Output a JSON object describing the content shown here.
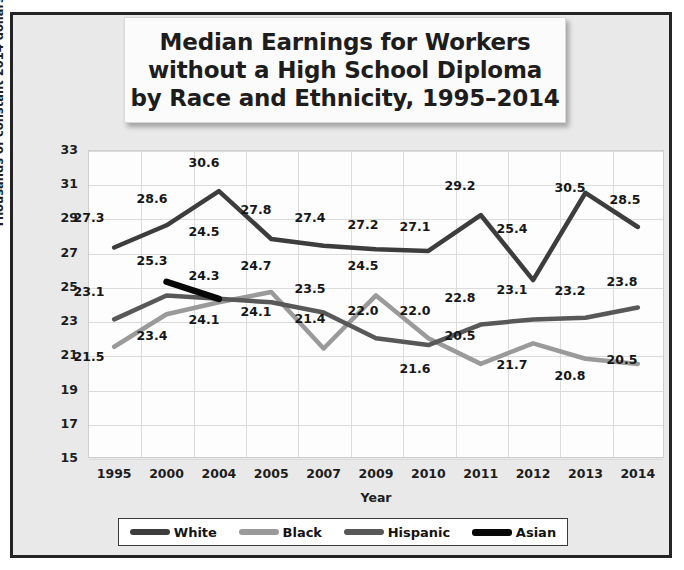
{
  "chart_data": {
    "type": "line",
    "title_lines": [
      "Median Earnings for Workers",
      "without a High School Diploma",
      "by Race and Ethnicity, 1995–2014"
    ],
    "xlabel": "Year",
    "ylabel": "Thousands of constant 2014 dollars",
    "categories": [
      "1995",
      "2000",
      "2004",
      "2005",
      "2007",
      "2009",
      "2010",
      "2011",
      "2012",
      "2013",
      "2014"
    ],
    "ylim": [
      15,
      33
    ],
    "yticks": [
      "33",
      "31",
      "29",
      "27",
      "25",
      "23",
      "21",
      "19",
      "17",
      "15"
    ],
    "grid": true,
    "legend_position": "bottom",
    "series": [
      {
        "name": "White",
        "color": "#3d3d3d",
        "width": 4.5,
        "values": [
          27.3,
          28.6,
          30.6,
          27.8,
          27.4,
          27.2,
          27.1,
          29.2,
          25.4,
          30.5,
          28.5
        ],
        "labels": [
          "27.3",
          "28.6",
          "30.6",
          "27.8",
          "27.4",
          "27.2",
          "27.1",
          "29.2",
          "25.4",
          "30.5",
          "28.5"
        ]
      },
      {
        "name": "Black",
        "color": "#9a9a9a",
        "width": 4.5,
        "values": [
          21.5,
          23.4,
          24.1,
          24.7,
          21.4,
          24.5,
          22.0,
          20.5,
          21.7,
          20.8,
          20.5
        ],
        "labels": [
          "21.5",
          "23.4",
          "24.1",
          "24.7",
          "21.4",
          "24.5",
          "22.0",
          "20.5",
          "21.7",
          "20.8",
          "20.5"
        ]
      },
      {
        "name": "Hispanic",
        "color": "#585858",
        "width": 4.5,
        "values": [
          23.1,
          24.5,
          24.3,
          24.1,
          23.5,
          22.0,
          21.6,
          22.8,
          23.1,
          23.2,
          23.8
        ],
        "labels": [
          "23.1",
          "24.5",
          "24.3",
          "24.1",
          "23.5",
          "22.0",
          "21.6",
          "22.8",
          "23.1",
          "23.2",
          "23.8"
        ]
      },
      {
        "name": "Asian",
        "color": "#080808",
        "width": 6.5,
        "values": [
          null,
          25.3,
          24.3,
          null,
          null,
          null,
          null,
          null,
          null,
          null,
          null
        ],
        "labels": [
          "",
          "25.3",
          "24.3",
          "",
          "",
          "",
          "",
          "",
          "",
          "",
          ""
        ]
      }
    ],
    "data_labels": [
      {
        "text": "27.3",
        "x": 89,
        "y": 218
      },
      {
        "text": "28.6",
        "x": 152,
        "y": 199
      },
      {
        "text": "30.6",
        "x": 204,
        "y": 163
      },
      {
        "text": "27.8",
        "x": 256,
        "y": 210
      },
      {
        "text": "27.4",
        "x": 310,
        "y": 218
      },
      {
        "text": "27.2",
        "x": 363,
        "y": 225
      },
      {
        "text": "27.1",
        "x": 415,
        "y": 227
      },
      {
        "text": "29.2",
        "x": 460,
        "y": 186
      },
      {
        "text": "25.4",
        "x": 512,
        "y": 229
      },
      {
        "text": "30.5",
        "x": 570,
        "y": 188
      },
      {
        "text": "28.5",
        "x": 625,
        "y": 200
      },
      {
        "text": "24.5",
        "x": 204,
        "y": 232
      },
      {
        "text": "25.3",
        "x": 152,
        "y": 261
      },
      {
        "text": "24.3",
        "x": 204,
        "y": 276
      },
      {
        "text": "24.7",
        "x": 256,
        "y": 266
      },
      {
        "text": "23.5",
        "x": 310,
        "y": 289
      },
      {
        "text": "22.0",
        "x": 363,
        "y": 311
      },
      {
        "text": "24.5",
        "x": 363,
        "y": 266
      },
      {
        "text": "22.0",
        "x": 415,
        "y": 311
      },
      {
        "text": "22.8",
        "x": 460,
        "y": 298
      },
      {
        "text": "23.1",
        "x": 512,
        "y": 290
      },
      {
        "text": "23.2",
        "x": 570,
        "y": 291
      },
      {
        "text": "23.8",
        "x": 622,
        "y": 282
      },
      {
        "text": "23.1",
        "x": 89,
        "y": 292
      },
      {
        "text": "21.5",
        "x": 89,
        "y": 357
      },
      {
        "text": "23.4",
        "x": 152,
        "y": 336
      },
      {
        "text": "24.1",
        "x": 204,
        "y": 320
      },
      {
        "text": "24.1",
        "x": 256,
        "y": 312
      },
      {
        "text": "21.4",
        "x": 310,
        "y": 319
      },
      {
        "text": "21.6",
        "x": 415,
        "y": 369
      },
      {
        "text": "20.5",
        "x": 460,
        "y": 336
      },
      {
        "text": "21.7",
        "x": 512,
        "y": 365
      },
      {
        "text": "20.8",
        "x": 570,
        "y": 376
      },
      {
        "text": "20.5",
        "x": 622,
        "y": 360
      }
    ]
  }
}
